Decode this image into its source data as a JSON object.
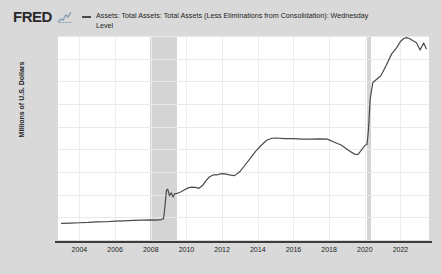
{
  "branding": {
    "logo_text": "FRED",
    "spark_icon": "sparkline-icon"
  },
  "legend": {
    "swatch_color": "#4a4a4a",
    "label": "Assets: Total Assets: Total Assets (Less Eliminations from Consolidation): Wednesday Level"
  },
  "chart_data": {
    "type": "line",
    "title": "",
    "xlabel": "",
    "ylabel": "Millions of U.S. Dollars",
    "xlim": [
      2002.8,
      2023.6
    ],
    "ylim": [
      0,
      9000000
    ],
    "grid": true,
    "legend_position": "top",
    "line_color": "#4a4a4a",
    "plot_background": "#ffffff",
    "figure_background": "#d9d9d9",
    "recession_band_color": "#d4d4d4",
    "ytick_labels": [
      "9,000,000",
      "8,000,000",
      "7,000,000",
      "6,000,000",
      "5,000,000",
      "4,000,000",
      "3,000,000",
      "2,000,000",
      "1,000,000",
      "0"
    ],
    "ytick_values": [
      9000000,
      8000000,
      7000000,
      6000000,
      5000000,
      4000000,
      3000000,
      2000000,
      1000000,
      0
    ],
    "xtick_labels": [
      "2004",
      "2006",
      "2008",
      "2010",
      "2012",
      "2014",
      "2016",
      "2018",
      "2020",
      "2022"
    ],
    "xtick_values": [
      2004,
      2006,
      2008,
      2010,
      2012,
      2014,
      2016,
      2018,
      2020,
      2022
    ],
    "recession_bands": [
      {
        "start": 2007.95,
        "end": 2009.45,
        "label": "2008 recession"
      },
      {
        "start": 2020.15,
        "end": 2020.35,
        "label": "2020 recession"
      }
    ],
    "series": [
      {
        "name": "Assets: Total Assets: Total Assets (Less Eliminations from Consolidation): Wednesday Level",
        "x": [
          2003.0,
          2003.5,
          2004.0,
          2004.5,
          2005.0,
          2005.5,
          2006.0,
          2006.5,
          2007.0,
          2007.5,
          2008.0,
          2008.3,
          2008.6,
          2008.72,
          2008.8,
          2008.88,
          2008.95,
          2009.05,
          2009.15,
          2009.25,
          2009.35,
          2009.5,
          2009.7,
          2009.9,
          2010.1,
          2010.3,
          2010.5,
          2010.7,
          2010.9,
          2011.1,
          2011.3,
          2011.5,
          2011.7,
          2011.9,
          2012.1,
          2012.4,
          2012.7,
          2013.0,
          2013.3,
          2013.6,
          2013.9,
          2014.2,
          2014.5,
          2014.8,
          2015.0,
          2015.5,
          2016.0,
          2016.5,
          2017.0,
          2017.5,
          2017.9,
          2018.3,
          2018.7,
          2019.1,
          2019.4,
          2019.6,
          2019.8,
          2020.0,
          2020.12,
          2020.2,
          2020.3,
          2020.45,
          2020.6,
          2020.9,
          2021.2,
          2021.5,
          2021.8,
          2022.0,
          2022.2,
          2022.35,
          2022.5,
          2022.7,
          2022.9,
          2023.1,
          2023.3,
          2023.45
        ],
        "y": [
          730000,
          745000,
          760000,
          775000,
          800000,
          805000,
          830000,
          845000,
          865000,
          875000,
          890000,
          880000,
          900000,
          950000,
          1500000,
          2200000,
          2240000,
          1950000,
          2080000,
          1900000,
          2050000,
          2060000,
          2130000,
          2220000,
          2300000,
          2330000,
          2320000,
          2280000,
          2400000,
          2620000,
          2790000,
          2870000,
          2870000,
          2920000,
          2930000,
          2870000,
          2840000,
          3020000,
          3320000,
          3620000,
          3930000,
          4180000,
          4400000,
          4490000,
          4500000,
          4470000,
          4470000,
          4450000,
          4450000,
          4460000,
          4450000,
          4310000,
          4180000,
          3950000,
          3800000,
          3760000,
          3950000,
          4170000,
          4210000,
          4800000,
          6200000,
          6950000,
          7050000,
          7250000,
          7700000,
          8200000,
          8500000,
          8760000,
          8900000,
          8930000,
          8890000,
          8790000,
          8700000,
          8380000,
          8690000,
          8440000
        ]
      }
    ]
  }
}
